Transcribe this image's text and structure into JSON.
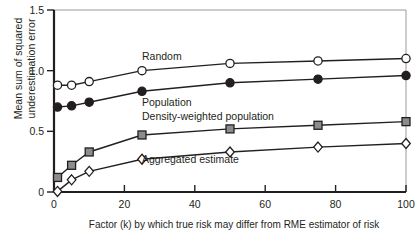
{
  "chart_data": {
    "type": "line",
    "title": "",
    "xlabel": "Factor (k) by which true risk may differ from RME estimator of risk",
    "ylabel": "Mean sum of squared\nunderestimation error",
    "x": [
      1,
      5,
      10,
      25,
      50,
      75,
      100
    ],
    "xlim": [
      0,
      100
    ],
    "ylim": [
      0,
      1.5
    ],
    "xticks": [
      0,
      20,
      40,
      60,
      80,
      100
    ],
    "xticklabels": [
      "0",
      "20",
      "40",
      "60",
      "80",
      "100"
    ],
    "yticks": [
      0,
      0.5,
      1.0,
      1.5
    ],
    "yticklabels": [
      "0",
      "0.5",
      "1.0",
      "1.5"
    ],
    "grid": false,
    "legend_position": "inline-annotations",
    "series": [
      {
        "name": "Random",
        "label": "Random",
        "marker": "open-circle",
        "marker_fill": "#ffffff",
        "marker_edge": "#231f20",
        "line_color": "#231f20",
        "values": [
          0.88,
          0.88,
          0.91,
          1.0,
          1.06,
          1.08,
          1.1
        ],
        "label_x": 25,
        "label_y": 1.12
      },
      {
        "name": "Population",
        "label": "Population",
        "marker": "filled-circle",
        "marker_fill": "#231f20",
        "marker_edge": "#231f20",
        "line_color": "#231f20",
        "values": [
          0.7,
          0.71,
          0.74,
          0.83,
          0.9,
          0.93,
          0.96
        ],
        "label_x": 25,
        "label_y": 0.74
      },
      {
        "name": "Density-weighted population",
        "label": "Density-weighted population",
        "marker": "filled-square",
        "marker_fill": "#8c8c8c",
        "marker_edge": "#231f20",
        "line_color": "#231f20",
        "values": [
          0.12,
          0.22,
          0.33,
          0.47,
          0.52,
          0.55,
          0.58
        ],
        "label_x": 25,
        "label_y": 0.63
      },
      {
        "name": "Aggregated estimate",
        "label": "Aggregated estimate",
        "marker": "open-diamond",
        "marker_fill": "#ffffff",
        "marker_edge": "#231f20",
        "line_color": "#231f20",
        "values": [
          0.005,
          0.1,
          0.17,
          0.27,
          0.33,
          0.37,
          0.4
        ],
        "label_x": 25,
        "label_y": 0.27
      }
    ],
    "colors": {
      "axis": "#231f20",
      "frame": "#9a9a9a",
      "text": "#231f20",
      "background": "#ffffff"
    }
  }
}
